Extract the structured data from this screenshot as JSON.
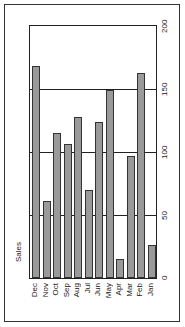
{
  "chart_data": {
    "type": "bar",
    "orientation": "rotated-90-ccw",
    "title": "",
    "xlabel": "",
    "ylabel": "Sales",
    "categories": [
      "Dec",
      "Nov",
      "Oct",
      "Sep",
      "Aug",
      "Jul",
      "Jun",
      "May",
      "Apr",
      "Mar",
      "Feb",
      "Jan"
    ],
    "values": [
      168,
      61,
      115,
      106,
      128,
      70,
      124,
      149,
      15,
      97,
      163,
      26
    ],
    "ylim": [
      0,
      200
    ],
    "yticks": [
      "0",
      "50",
      "100",
      "150",
      "200"
    ],
    "grid": true,
    "legend": null,
    "colors": {
      "bar": "#9a9a9a",
      "bar_border": "#333333",
      "grid": "#222222"
    }
  }
}
